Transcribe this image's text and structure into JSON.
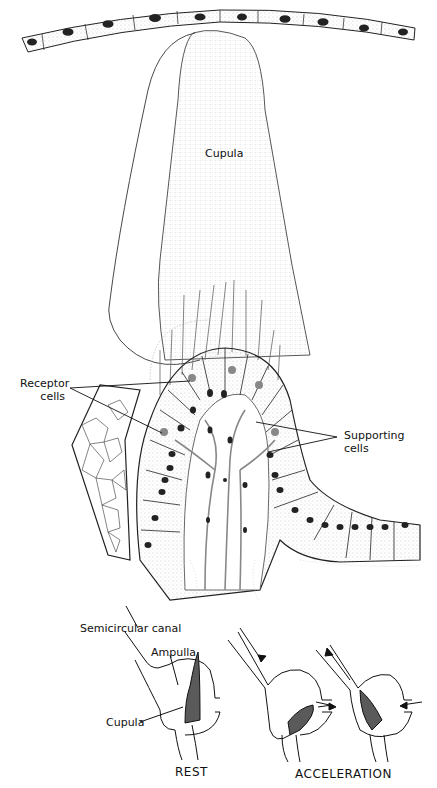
{
  "figure": {
    "main_illustration": {
      "labels": {
        "cupula": "Cupula",
        "receptor_line1": "Receptor",
        "receptor_line2": "cells",
        "supporting_line1": "Supporting",
        "supporting_line2": "cells"
      }
    },
    "schematic": {
      "labels": {
        "semicircular_canal": "Semicircular canal",
        "ampulla": "Ampulla",
        "cupula": "Cupula"
      },
      "captions": {
        "rest": "REST",
        "acceleration": "ACCELERATION"
      }
    },
    "colors": {
      "ink": "#111111",
      "cupula_fill_schematic": "#5a5a5a",
      "stipple": "#9a9a9a",
      "background": "#ffffff"
    }
  }
}
